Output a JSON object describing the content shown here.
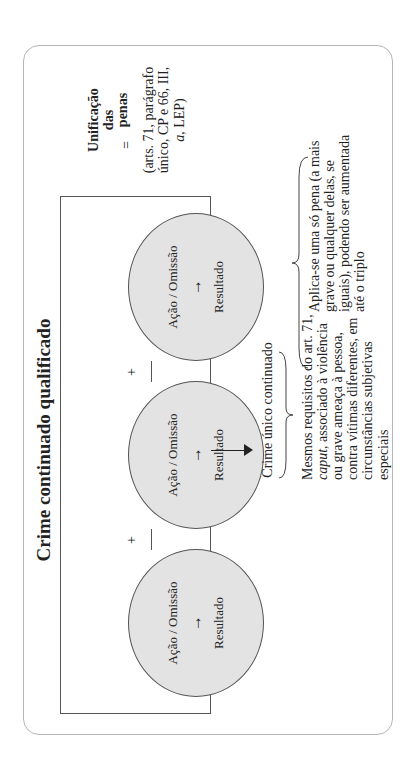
{
  "diagram": {
    "title": "Crime continuado qualificado",
    "orientation": "rotated-90-ccw",
    "circles": [
      {
        "action": "Ação / Omissão",
        "arrow": "→",
        "result": "Resultado"
      },
      {
        "action": "Ação / Omissão",
        "arrow": "→",
        "result": "Resultado"
      },
      {
        "action": "Ação / Omissão",
        "arrow": "→",
        "result": "Resultado"
      }
    ],
    "plus_signs": [
      "+",
      "+"
    ],
    "outcome_label": "Crime único continuado",
    "requirements": {
      "line1": "Mesmos requisitos do art. 71,",
      "line2_italic": "caput",
      "line2_rest": ", associado à violência",
      "line3": "ou grave ameaça à pessoa,",
      "line4": "contra vítimas diferentes, em",
      "line5": "circunstâncias subjetivas",
      "line6": "especiais"
    },
    "penalty": {
      "line1": "Aplica-se uma só pena (a mais",
      "line2": "grave ou qualquer delas, se",
      "line3": "iguais), podendo ser aumentada",
      "line4": "até o triplo"
    },
    "unification": {
      "equals": "=",
      "line1": "Unificação",
      "line2": "das",
      "line3": "penas",
      "refs_line1": "(arts. 71, parágrafo",
      "refs_line2": "único, CP e 66, III,",
      "refs_line3_italic": "a",
      "refs_line3_rest": ", LEP)"
    },
    "colors": {
      "circle_fill": "#e3e3e3",
      "stroke": "#555555",
      "outer_border": "#b5b5b5"
    }
  }
}
